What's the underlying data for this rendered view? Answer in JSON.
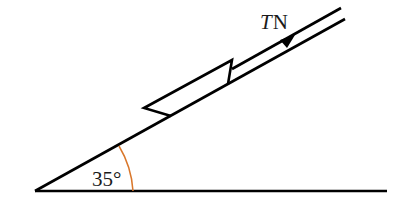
{
  "diagram": {
    "type": "inclined-plane-force-diagram",
    "angle_label": "35°",
    "angle_degrees": 35,
    "force_label_italic": "T",
    "force_label_unit": "N",
    "colors": {
      "lines": "#000000",
      "angle_arc": "#d9772b",
      "text": "#1a1a1a",
      "background": "#ffffff"
    }
  }
}
